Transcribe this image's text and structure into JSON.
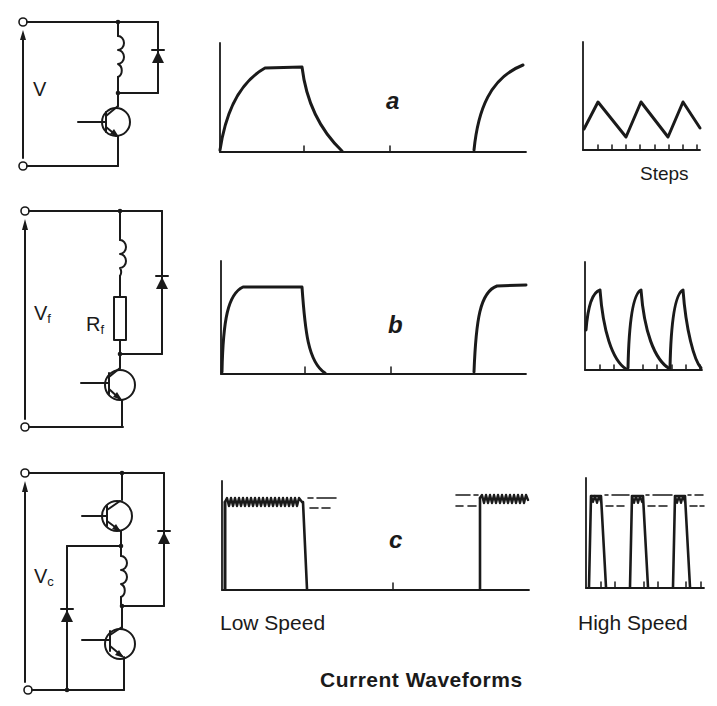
{
  "title": "Current Waveforms",
  "circuits": [
    {
      "id": "a",
      "voltage_label": "V",
      "voltage_sub": "",
      "components": [
        "inductor",
        "freewheel-diode",
        "transistor"
      ]
    },
    {
      "id": "b",
      "voltage_label": "V",
      "voltage_sub": "f",
      "resistor_label": "R",
      "resistor_sub": "f",
      "components": [
        "inductor",
        "resistor",
        "freewheel-diode",
        "transistor"
      ]
    },
    {
      "id": "c",
      "voltage_label": "V",
      "voltage_sub": "c",
      "components": [
        "upper-transistor",
        "inductor",
        "lower-transistor",
        "left-diode",
        "right-diode"
      ]
    }
  ],
  "waveforms": {
    "a": {
      "letter": "a",
      "low_speed": "slow exponential rise to flat top, exponential decay",
      "high_speed": "triangular ripple"
    },
    "b": {
      "letter": "b",
      "low_speed": "fast rise to flat top, fast decay",
      "high_speed": "sharp peaks with exponential decay"
    },
    "c": {
      "letter": "c",
      "low_speed": "chopped flat top between two dashed thresholds",
      "high_speed": "chopped pulses between thresholds"
    }
  },
  "labels": {
    "steps": "Steps",
    "low_speed": "Low Speed",
    "high_speed": "High Speed"
  },
  "colors": {
    "ink": "#1a1a1a",
    "background": "#ffffff"
  }
}
